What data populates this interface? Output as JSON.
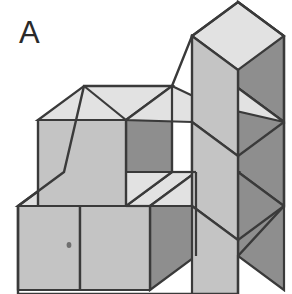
{
  "figure": {
    "label": "A",
    "type": "isometric-cube-stack",
    "background_color": "#ffffff",
    "colors": {
      "top_face": "#e2e2e2",
      "front_face": "#c4c4c4",
      "side_face": "#8e8e8e",
      "outline": "#3a3a3a",
      "label_text": "#2a2a2a",
      "speck": "#6f6f6f"
    },
    "stroke_width": 2.2,
    "projection": {
      "cube_width": 88,
      "cube_height": 86,
      "depth_x": 46,
      "depth_y": -34,
      "origin_x": 38,
      "origin_y": 120
    },
    "counts": {
      "visible_top_faces": 6,
      "visible_front_faces": 6,
      "visible_side_faces": 6
    },
    "faces": [
      {
        "id": "top-left-back-top",
        "kind": "top",
        "points": "38,120 84,86 172,86 126,120",
        "fill": "#e2e2e2"
      },
      {
        "id": "top-mid-back-top",
        "kind": "top",
        "points": "126,120 172,86 260,86 214,120",
        "fill": "#e2e2e2"
      },
      {
        "id": "top-tall-cube-top",
        "kind": "top",
        "points": "192,36 238,2 284,2 284,36",
        "fill": "#e2e2e2"
      },
      {
        "id": "top-notch-step",
        "kind": "top",
        "points": "126,206 172,172 214,172 168,206",
        "fill": "#e2e2e2"
      },
      {
        "id": "top-front-left-low",
        "kind": "top",
        "points": "18,206 64,172 126,172 80,206",
        "fill": "#e2e2e2"
      },
      {
        "id": "top-right-low-step",
        "kind": "top",
        "points": "168,206 214,172 284,172 284,206",
        "fill": "#e2e2e2"
      },
      {
        "id": "front-tall-cube",
        "kind": "front",
        "points": "192,36 284,36 284,122 192,122",
        "fill": "#c4c4c4"
      },
      {
        "id": "front-left-upper",
        "kind": "front",
        "points": "38,120 126,120 126,206 38,206",
        "fill": "#c4c4c4"
      },
      {
        "id": "front-mid-upper",
        "kind": "front",
        "points": "172,120 214,120 214,206 172,206",
        "fill": "#c4c4c4"
      },
      {
        "id": "front-low-left",
        "kind": "front",
        "points": "18,206 80,206 80,290 18,290",
        "fill": "#c4c4c4"
      },
      {
        "id": "front-low-mid",
        "kind": "front",
        "points": "80,206 150,206 150,290 80,290",
        "fill": "#c4c4c4"
      },
      {
        "id": "front-right-lower",
        "kind": "front",
        "points": "168,206 252,206 252,290 168,290",
        "fill": "#c4c4c4"
      },
      {
        "id": "side-tall-cube",
        "kind": "side",
        "points": "284,2 284,122 284,122 284,2",
        "fill": "#8e8e8e"
      },
      {
        "id": "side-left-upper",
        "kind": "side",
        "points": "126,120 172,86 172,172 126,206",
        "fill": "#8e8e8e"
      },
      {
        "id": "side-low-mid",
        "kind": "side",
        "points": "150,206 196,172 196,256 150,290",
        "fill": "#8e8e8e"
      },
      {
        "id": "side-right-column",
        "kind": "side",
        "points": "252,206 284,172 284,256 252,290",
        "fill": "#8e8e8e"
      }
    ],
    "speck": {
      "cx": 69,
      "cy": 245,
      "r": 2.2
    }
  }
}
